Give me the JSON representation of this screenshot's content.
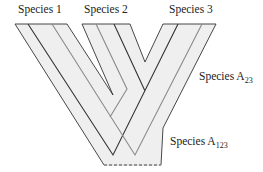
{
  "diagram": {
    "labels": {
      "species1": "Species 1",
      "species2": "Species 2",
      "species3": "Species 3",
      "ancestor23_base": "Species A",
      "ancestor23_sub": "23",
      "ancestor123_base": "Species A",
      "ancestor123_sub": "123"
    },
    "colors": {
      "tube_fill": "#efefef",
      "tube_outline": "#333333",
      "gene_dark": "#333333",
      "gene_gray": "#8a8a8a",
      "root_dashed": "#333333"
    }
  }
}
